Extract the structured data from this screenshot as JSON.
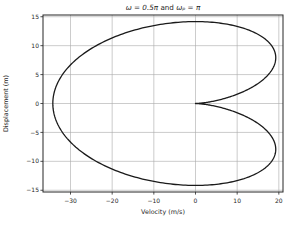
{
  "chart_data": {
    "type": "line",
    "subtype": "parametric-phase-space-curve",
    "title": "ω = 0.5π and ωₚ = π",
    "title_parts": [
      "ω = 0.5π",
      " and ",
      "ωₚ = π"
    ],
    "xlabel": "Velocity (m/s)",
    "ylabel": "Displacement (m)",
    "xlim": [
      -36.6,
      21.0
    ],
    "ylim": [
      -15.3,
      15.3
    ],
    "xticks": [
      -30,
      -20,
      -10,
      0,
      10,
      20
    ],
    "xtick_labels": [
      "−30",
      "−20",
      "−10",
      "0",
      "10",
      "20"
    ],
    "yticks": [
      15,
      10,
      5,
      0,
      -5,
      -10,
      -15
    ],
    "ytick_labels": [
      "15",
      "10",
      "5",
      "0",
      "−5",
      "−10",
      "−15"
    ],
    "grid": true,
    "grid_color": "#aaaaaa",
    "axis_color": "#262626",
    "background_color": "#ffffff",
    "series": [
      {
        "name": "trajectory",
        "color": "#1a1a1a",
        "line_width": 1.3,
        "parametric": {
          "C": 10.9,
          "omega": 1.5707963268,
          "omega_p": 3.1415926536,
          "t_range": [
            0,
            4
          ],
          "samples": 480,
          "velocity_expr": "C*omega*(cos(omega*t) - cos(omega_p*t))",
          "displacement_expr": "C*(sin(omega*t) - (omega/omega_p)*sin(omega_p*t))"
        },
        "key_points": {
          "cusp": [
            0,
            0
          ],
          "leftmost": [
            -34.2,
            0
          ],
          "top": [
            0,
            14.2
          ],
          "bottom": [
            0,
            -14.2
          ],
          "right_upper": [
            19.3,
            7.9
          ],
          "right_lower": [
            19.3,
            -7.9
          ]
        }
      }
    ]
  }
}
